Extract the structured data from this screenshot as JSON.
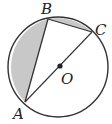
{
  "diagram": {
    "type": "geometry-circle",
    "labels": {
      "A": "A",
      "B": "B",
      "C": "C",
      "O": "O"
    },
    "colors": {
      "stroke": "#333333",
      "shade": "#c8c8c8",
      "background": "#ffffff"
    }
  }
}
